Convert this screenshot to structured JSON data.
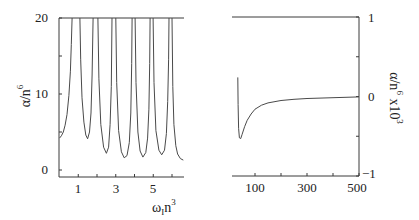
{
  "chart_data": [
    {
      "type": "line",
      "panel": "left",
      "title": "",
      "xlabel": "ω_I n^3",
      "ylabel": "α/n^6",
      "xlim": [
        0,
        6.65
      ],
      "ylim": [
        -0.9,
        20
      ],
      "xticks": [
        1,
        3,
        5
      ],
      "xticks_minor": [
        2,
        4,
        6
      ],
      "yticks": [
        0,
        10,
        20
      ],
      "yticks_minor": [
        5,
        15
      ],
      "grid": false,
      "legend": null,
      "poles": [
        0.67,
        1.09,
        1.79,
        2.05,
        2.8,
        3.0,
        3.87,
        4.03,
        4.83,
        4.99,
        5.84,
        6.0
      ],
      "branches": [
        {
          "x": [
            0.0,
            0.1,
            0.2,
            0.3,
            0.4,
            0.5,
            0.58,
            0.63,
            0.67
          ],
          "y": [
            4.2,
            4.5,
            5.0,
            5.9,
            7.3,
            9.8,
            13.0,
            16.5,
            20
          ]
        },
        {
          "x": [
            1.09,
            1.13,
            1.2,
            1.3,
            1.4,
            1.5,
            1.6,
            1.68,
            1.74,
            1.79
          ],
          "y": [
            20,
            14.5,
            9.5,
            6.3,
            4.6,
            4.1,
            5.0,
            7.5,
            12.5,
            20
          ]
        },
        {
          "x": [
            2.05,
            2.1,
            2.2,
            2.35,
            2.5,
            2.62,
            2.7,
            2.76,
            2.8
          ],
          "y": [
            20,
            12.0,
            6.0,
            3.0,
            2.2,
            3.0,
            6.0,
            11.0,
            20
          ]
        },
        {
          "x": [
            3.0,
            3.05,
            3.15,
            3.3,
            3.45,
            3.6,
            3.72,
            3.8,
            3.85,
            3.87
          ],
          "y": [
            20,
            11.5,
            5.2,
            2.4,
            1.6,
            1.9,
            3.6,
            7.5,
            14.0,
            20
          ]
        },
        {
          "x": [
            4.03,
            4.08,
            4.18,
            4.3,
            4.45,
            4.6,
            4.7,
            4.77,
            4.81,
            4.83
          ],
          "y": [
            20,
            11.5,
            5.0,
            2.5,
            1.7,
            2.3,
            4.2,
            8.0,
            14.0,
            20
          ]
        },
        {
          "x": [
            4.99,
            5.04,
            5.14,
            5.3,
            5.45,
            5.6,
            5.7,
            5.77,
            5.82,
            5.84
          ],
          "y": [
            20,
            11.5,
            5.2,
            2.6,
            2.0,
            2.6,
            4.8,
            9.0,
            14.5,
            20
          ]
        },
        {
          "x": [
            6.0,
            6.04,
            6.1,
            6.2,
            6.3,
            6.45,
            6.6
          ],
          "y": [
            20,
            11.0,
            6.0,
            3.2,
            2.1,
            1.5,
            1.3
          ]
        }
      ]
    },
    {
      "type": "line",
      "panel": "right",
      "title": "",
      "xlabel": "",
      "ylabel": "α/n^6 x10^3",
      "ylabel_position": "right",
      "xlim": [
        12,
        500
      ],
      "ylim": [
        -1,
        1
      ],
      "xticks": [
        100,
        300,
        500
      ],
      "xticks_minor": [
        200,
        400
      ],
      "yticks": [
        -1,
        0,
        1
      ],
      "yticks_minor": [
        -0.5,
        0.5
      ],
      "grid": false,
      "legend": null,
      "series": [
        {
          "name": "α/n^6 x10^3",
          "x": [
            34,
            35,
            37,
            40,
            45,
            50,
            60,
            70,
            85,
            100,
            125,
            150,
            200,
            250,
            300,
            350,
            400,
            450,
            500
          ],
          "y": [
            0.24,
            -0.1,
            -0.4,
            -0.52,
            -0.53,
            -0.48,
            -0.38,
            -0.3,
            -0.22,
            -0.16,
            -0.11,
            -0.08,
            -0.05,
            -0.035,
            -0.025,
            -0.02,
            -0.015,
            -0.01,
            -0.005
          ]
        }
      ]
    }
  ],
  "labels": {
    "left_ylabel": "α/n",
    "left_ylabel_sup": "6",
    "left_xlabel": "ω",
    "left_xlabel_sub": "I",
    "left_xlabel_mid": "n",
    "left_xlabel_sup": "3",
    "right_ylabel": "α/n",
    "right_ylabel_sup": "6",
    "right_ylabel_tail": " x10",
    "right_ylabel_tail_sup": "3",
    "left_ytick_labels": [
      "0",
      "10",
      "20"
    ],
    "left_xtick_labels": [
      "1",
      "3",
      "5"
    ],
    "right_ytick_labels": [
      "−1",
      "0",
      "1"
    ],
    "right_xtick_labels": [
      "100",
      "300",
      "500"
    ]
  }
}
